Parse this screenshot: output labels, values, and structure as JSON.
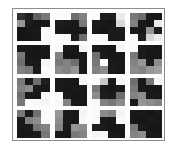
{
  "figure": {
    "type": "image-grid",
    "title": "",
    "rows": 4,
    "columns": 4,
    "patch_count": 16,
    "patch_rows": 4,
    "patch_columns": 4,
    "colormap": "grayscale",
    "value_range": [
      0,
      255
    ],
    "background_color": "#ffffff",
    "panel_background": "#fdfdfd",
    "panel_border_color": "#8d8d8d"
  },
  "chart_data": {
    "type": "heatmap",
    "title": "",
    "subtitle": "",
    "xlabel": "",
    "ylabel": "",
    "grid": false,
    "legend": "none",
    "colormap": "gray",
    "vmin": 0,
    "vmax": 255,
    "tile_rows": 4,
    "tile_columns": 4,
    "cell_rows": 4,
    "cell_columns": 4,
    "tiles": [
      {
        "index": 0,
        "row": 0,
        "col": 0,
        "values": [
          [
            48,
            30,
            96,
            120
          ],
          [
            150,
            28,
            22,
            26
          ],
          [
            22,
            24,
            26,
            250
          ],
          [
            20,
            22,
            24,
            248
          ]
        ]
      },
      {
        "index": 1,
        "row": 0,
        "col": 1,
        "values": [
          [
            250,
            252,
            110,
            130
          ],
          [
            30,
            26,
            24,
            120
          ],
          [
            26,
            22,
            24,
            26
          ],
          [
            250,
            248,
            28,
            110
          ]
        ]
      },
      {
        "index": 2,
        "row": 0,
        "col": 2,
        "values": [
          [
            250,
            30,
            28,
            235
          ],
          [
            26,
            24,
            22,
            215
          ],
          [
            24,
            22,
            26,
            28
          ],
          [
            250,
            248,
            26,
            24
          ]
        ]
      },
      {
        "index": 3,
        "row": 0,
        "col": 3,
        "values": [
          [
            120,
            110,
            26,
            24
          ],
          [
            130,
            26,
            22,
            235
          ],
          [
            26,
            24,
            150,
            30
          ],
          [
            250,
            30,
            215,
            235
          ]
        ]
      },
      {
        "index": 4,
        "row": 1,
        "col": 0,
        "values": [
          [
            26,
            24,
            22,
            26
          ],
          [
            120,
            24,
            22,
            24
          ],
          [
            110,
            26,
            24,
            245
          ],
          [
            130,
            120,
            26,
            250
          ]
        ]
      },
      {
        "index": 5,
        "row": 1,
        "col": 1,
        "values": [
          [
            250,
            26,
            24,
            245
          ],
          [
            130,
            24,
            22,
            26
          ],
          [
            120,
            130,
            110,
            24
          ],
          [
            140,
            130,
            150,
            26
          ]
        ]
      },
      {
        "index": 6,
        "row": 1,
        "col": 2,
        "values": [
          [
            26,
            24,
            22,
            245
          ],
          [
            110,
            26,
            22,
            24
          ],
          [
            120,
            250,
            26,
            24
          ],
          [
            130,
            140,
            26,
            24
          ]
        ]
      },
      {
        "index": 7,
        "row": 1,
        "col": 3,
        "values": [
          [
            250,
            26,
            24,
            22
          ],
          [
            120,
            26,
            22,
            24
          ],
          [
            130,
            150,
            26,
            140
          ],
          [
            140,
            130,
            150,
            160
          ]
        ]
      },
      {
        "index": 8,
        "row": 2,
        "col": 0,
        "values": [
          [
            120,
            26,
            110,
            30
          ],
          [
            130,
            140,
            26,
            24
          ],
          [
            110,
            26,
            24,
            245
          ],
          [
            120,
            250,
            248,
            245
          ]
        ]
      },
      {
        "index": 9,
        "row": 2,
        "col": 1,
        "values": [
          [
            26,
            24,
            22,
            245
          ],
          [
            26,
            22,
            24,
            26
          ],
          [
            250,
            26,
            22,
            24
          ],
          [
            248,
            130,
            26,
            24
          ]
        ]
      },
      {
        "index": 10,
        "row": 2,
        "col": 2,
        "values": [
          [
            250,
            200,
            26,
            245
          ],
          [
            120,
            26,
            24,
            26
          ],
          [
            140,
            30,
            26,
            110
          ],
          [
            248,
            130,
            120,
            140
          ]
        ]
      },
      {
        "index": 11,
        "row": 2,
        "col": 3,
        "values": [
          [
            110,
            26,
            120,
            245
          ],
          [
            120,
            26,
            24,
            22
          ],
          [
            130,
            140,
            26,
            24
          ],
          [
            26,
            150,
            140,
            130
          ]
        ]
      },
      {
        "index": 12,
        "row": 3,
        "col": 0,
        "values": [
          [
            120,
            26,
            110,
            250
          ],
          [
            26,
            130,
            140,
            248
          ],
          [
            24,
            26,
            120,
            130
          ],
          [
            22,
            24,
            26,
            120
          ]
        ]
      },
      {
        "index": 13,
        "row": 3,
        "col": 1,
        "values": [
          [
            150,
            26,
            24,
            245
          ],
          [
            140,
            26,
            22,
            250
          ],
          [
            130,
            26,
            150,
            140
          ],
          [
            26,
            24,
            120,
            130
          ]
        ]
      },
      {
        "index": 14,
        "row": 3,
        "col": 2,
        "values": [
          [
            250,
            140,
            130,
            245
          ],
          [
            248,
            26,
            24,
            250
          ],
          [
            30,
            26,
            22,
            24
          ],
          [
            245,
            248,
            26,
            24
          ]
        ]
      },
      {
        "index": 15,
        "row": 3,
        "col": 3,
        "values": [
          [
            26,
            24,
            22,
            26
          ],
          [
            24,
            22,
            26,
            24
          ],
          [
            120,
            26,
            24,
            22
          ],
          [
            130,
            140,
            26,
            24
          ]
        ]
      }
    ]
  }
}
